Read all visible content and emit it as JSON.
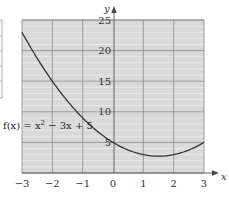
{
  "chart_data": {
    "type": "line",
    "title": "",
    "xlabel": "x",
    "ylabel": "y",
    "xlim": [
      -3,
      3
    ],
    "ylim": [
      0,
      25
    ],
    "grid": true,
    "x_ticks": [
      "−3",
      "−2",
      "−1",
      "0",
      "1",
      "2",
      "3"
    ],
    "y_ticks": [
      "5",
      "10",
      "15",
      "20",
      "25"
    ],
    "annotation": {
      "prefix": "f(x) = x",
      "exponent": "2",
      "suffix": " − 3x + 5"
    },
    "series": [
      {
        "name": "f(x) = x^2 - 3x + 5",
        "x": [
          -3,
          -2.5,
          -2,
          -1.5,
          -1,
          -0.5,
          0,
          0.5,
          1,
          1.5,
          2,
          2.5,
          3
        ],
        "values": [
          23,
          18.75,
          15,
          11.75,
          9,
          6.75,
          5,
          3.75,
          3,
          2.75,
          3,
          3.75,
          5
        ]
      }
    ],
    "colors": {
      "plot_background": "#d9d9d9",
      "major_grid": "#8a8a8a",
      "minor_grid": "#f0f0f0",
      "curve": "#333333",
      "axis": "#555555"
    }
  },
  "labels": {
    "x_axis": "x",
    "y_axis": "y",
    "tick_x": [
      "−3",
      "−2",
      "−1",
      "0",
      "1",
      "2",
      "3"
    ],
    "tick_y": [
      "5",
      "10",
      "15",
      "20",
      "25"
    ]
  }
}
